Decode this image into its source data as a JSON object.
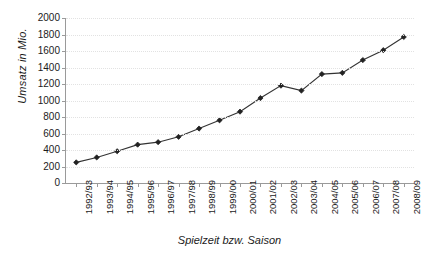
{
  "chart_data": {
    "type": "line",
    "title": "",
    "xlabel": "Spielzeit bzw. Saison",
    "ylabel": "Umsatz in Mio.",
    "ylim": [
      0,
      2000
    ],
    "ytick_step": 200,
    "yticks": [
      2000,
      1800,
      1600,
      1400,
      1200,
      1000,
      800,
      600,
      400,
      200,
      0
    ],
    "ytick_labels": [
      "2000",
      "1800",
      "1600",
      "1400",
      "1200",
      "1000",
      "800",
      "600",
      "400",
      "200",
      "0"
    ],
    "grid": true,
    "legend": "none",
    "marker": "diamond",
    "line_color": "#333333",
    "marker_color": "#222222",
    "categories": [
      "1992/93",
      "1993/94",
      "1994/95",
      "1995/96",
      "1996/97",
      "1997/98",
      "1998/99",
      "1999/00",
      "2000/01",
      "2001/02",
      "2002/03",
      "2003/04",
      "2004/05",
      "2005/06",
      "2006/07",
      "2007/08",
      "2008/09"
    ],
    "values": [
      250,
      310,
      385,
      465,
      495,
      560,
      660,
      760,
      865,
      1030,
      1180,
      1120,
      1320,
      1335,
      1490,
      1610,
      1770
    ],
    "series": [
      {
        "name": "Umsatz",
        "values": [
          250,
          310,
          385,
          465,
          495,
          560,
          660,
          760,
          865,
          1030,
          1180,
          1120,
          1320,
          1335,
          1490,
          1610,
          1770
        ]
      }
    ]
  }
}
